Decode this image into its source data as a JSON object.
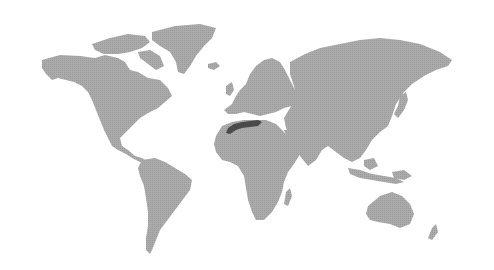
{
  "map": {
    "type": "world-choropleth",
    "projection": "miller-like",
    "base_color": "#a9a9a9",
    "highlight_color": "#4a4a4a",
    "background": "#ffffff",
    "highlighted_region": "Maghreb (Morocco / northern Algeria)",
    "continents": [
      "North America",
      "Greenland",
      "South America",
      "Europe",
      "Africa",
      "Asia",
      "Australia",
      "New Zealand",
      "Madagascar",
      "Japan",
      "Indonesia",
      "United Kingdom",
      "Iceland"
    ]
  }
}
